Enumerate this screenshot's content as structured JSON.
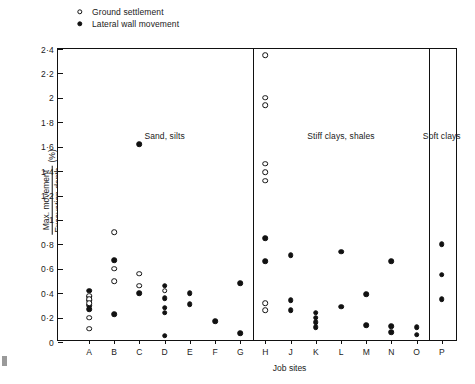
{
  "legend": {
    "items": [
      {
        "marker": "open-circle-icon",
        "label": "Ground settlement"
      },
      {
        "marker": "filled-circle-icon",
        "label": "Lateral wall movement"
      }
    ]
  },
  "axes": {
    "y_label_numerator": "Max. movement",
    "y_label_denominator": "Excavation depth",
    "y_label_units": "(%)",
    "x_label": "Job sites",
    "y_ticks": [
      "0",
      "0·2",
      "0·4",
      "0·6",
      "0·8",
      "1",
      "1·2",
      "1·4",
      "1·6",
      "1·8",
      "2",
      "2·2",
      "2·4"
    ],
    "x_ticks": [
      "A",
      "B",
      "C",
      "D",
      "E",
      "F",
      "G",
      "H",
      "J",
      "K",
      "L",
      "M",
      "N",
      "O",
      "P"
    ]
  },
  "sections": [
    {
      "label": "Sand, silts"
    },
    {
      "label": "Stiff clays, shales"
    },
    {
      "label": "Soft clays"
    }
  ],
  "chart_data": {
    "type": "scatter",
    "title": "",
    "xlabel": "Job sites",
    "ylabel": "Max. movement / Excavation depth (%)",
    "ylim": [
      0,
      2.4
    ],
    "ytick_values": [
      0,
      0.2,
      0.4,
      0.6,
      0.8,
      1.0,
      1.2,
      1.4,
      1.6,
      1.8,
      2.0,
      2.2,
      2.4
    ],
    "categories": [
      "A",
      "B",
      "C",
      "D",
      "E",
      "F",
      "G",
      "H",
      "J",
      "K",
      "L",
      "M",
      "N",
      "O",
      "P"
    ],
    "grid": false,
    "legend_position": "above-plot-left",
    "section_groups": [
      {
        "label": "Sand, silts",
        "categories": [
          "A",
          "B",
          "C",
          "D",
          "E",
          "F",
          "G"
        ]
      },
      {
        "label": "Stiff clays, shales",
        "categories": [
          "H",
          "J",
          "K",
          "L",
          "M",
          "N",
          "O"
        ]
      },
      {
        "label": "Soft clays",
        "categories": [
          "P"
        ]
      }
    ],
    "series": [
      {
        "name": "Ground settlement",
        "marker": "open-circle",
        "points": [
          {
            "x": "A",
            "y": 0.38
          },
          {
            "x": "A",
            "y": 0.35
          },
          {
            "x": "A",
            "y": 0.32
          },
          {
            "x": "A",
            "y": 0.2
          },
          {
            "x": "A",
            "y": 0.11
          },
          {
            "x": "B",
            "y": 0.9
          },
          {
            "x": "B",
            "y": 0.6
          },
          {
            "x": "B",
            "y": 0.5
          },
          {
            "x": "C",
            "y": 0.56
          },
          {
            "x": "C",
            "y": 0.46
          },
          {
            "x": "D",
            "y": 0.42
          },
          {
            "x": "H",
            "y": 2.35
          },
          {
            "x": "H",
            "y": 2.0
          },
          {
            "x": "H",
            "y": 1.94
          },
          {
            "x": "H",
            "y": 1.46
          },
          {
            "x": "H",
            "y": 1.39
          },
          {
            "x": "H",
            "y": 1.32
          },
          {
            "x": "H",
            "y": 0.32
          },
          {
            "x": "H",
            "y": 0.26
          }
        ]
      },
      {
        "name": "Lateral wall movement",
        "marker": "filled-circle",
        "points": [
          {
            "x": "A",
            "y": 0.42
          },
          {
            "x": "A",
            "y": 0.37
          },
          {
            "x": "A",
            "y": 0.34
          },
          {
            "x": "A",
            "y": 0.3
          },
          {
            "x": "A",
            "y": 0.27
          },
          {
            "x": "B",
            "y": 0.67
          },
          {
            "x": "B",
            "y": 0.23
          },
          {
            "x": "C",
            "y": 1.62
          },
          {
            "x": "C",
            "y": 0.4
          },
          {
            "x": "D",
            "y": 0.46
          },
          {
            "x": "D",
            "y": 0.36
          },
          {
            "x": "D",
            "y": 0.28
          },
          {
            "x": "D",
            "y": 0.24
          },
          {
            "x": "D",
            "y": 0.05
          },
          {
            "x": "E",
            "y": 0.4
          },
          {
            "x": "E",
            "y": 0.31
          },
          {
            "x": "F",
            "y": 0.17
          },
          {
            "x": "G",
            "y": 0.48
          },
          {
            "x": "G",
            "y": 0.07
          },
          {
            "x": "H",
            "y": 0.85
          },
          {
            "x": "H",
            "y": 0.66
          },
          {
            "x": "J",
            "y": 0.71
          },
          {
            "x": "J",
            "y": 0.34
          },
          {
            "x": "J",
            "y": 0.26
          },
          {
            "x": "K",
            "y": 0.24
          },
          {
            "x": "K",
            "y": 0.2
          },
          {
            "x": "K",
            "y": 0.16
          },
          {
            "x": "K",
            "y": 0.12
          },
          {
            "x": "L",
            "y": 0.74
          },
          {
            "x": "L",
            "y": 0.29
          },
          {
            "x": "M",
            "y": 0.39
          },
          {
            "x": "M",
            "y": 0.14
          },
          {
            "x": "N",
            "y": 0.66
          },
          {
            "x": "N",
            "y": 0.13
          },
          {
            "x": "N",
            "y": 0.08
          },
          {
            "x": "O",
            "y": 0.12
          },
          {
            "x": "O",
            "y": 0.06
          },
          {
            "x": "P",
            "y": 0.8
          },
          {
            "x": "P",
            "y": 0.55
          },
          {
            "x": "P",
            "y": 0.35
          }
        ]
      }
    ],
    "dividers_after": [
      "G",
      "O"
    ]
  }
}
